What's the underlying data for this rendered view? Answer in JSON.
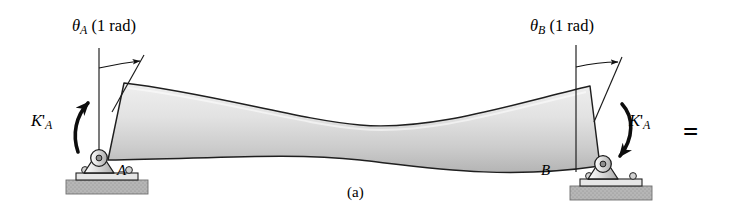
{
  "figure": {
    "caption": "(a)",
    "equals_symbol": "=",
    "background_color": "#ffffff",
    "beam_fill_light": "#f4f4f4",
    "beam_fill_dark": "#b9b9b9",
    "outline_color": "#1a1a1a",
    "ground_fill": "#b0b0b0",
    "support_fill": "#d8d8d8"
  },
  "labels": {
    "theta_a": {
      "symbol": "θ",
      "subscript": "A",
      "value": "(1 rad)"
    },
    "theta_b": {
      "symbol": "θ",
      "subscript": "B",
      "value": "(1 rad)"
    },
    "moment_left": {
      "symbol": "K",
      "prime": "'",
      "subscript": "A"
    },
    "moment_right": {
      "symbol": "K",
      "prime": "'",
      "subscript": "A"
    },
    "support_a": "A",
    "support_b": "B"
  },
  "icons": {
    "pin_support_a": "pin-support-icon",
    "pin_support_b": "pin-support-icon",
    "ground_block_a": "ground-hatch-icon",
    "ground_block_b": "ground-hatch-icon",
    "rotation_arrow_left": "curved-arrow-ccw-icon",
    "rotation_arrow_right": "curved-arrow-cw-icon",
    "angle_arc_a": "angle-arc-icon",
    "angle_arc_b": "angle-arc-icon"
  }
}
